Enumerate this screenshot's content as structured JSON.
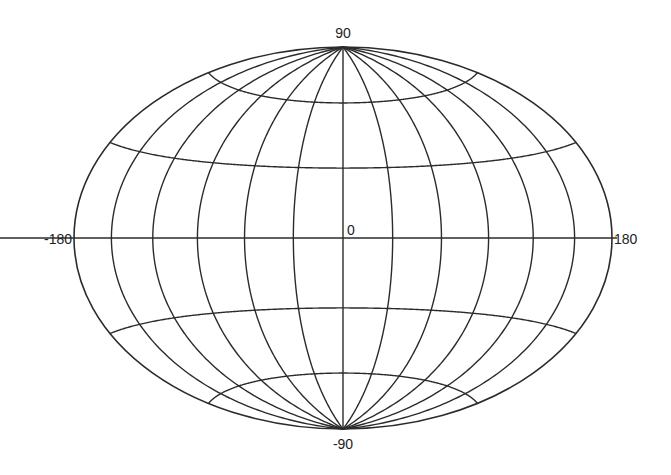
{
  "diagram": {
    "type": "map-projection-graticule",
    "projection": "Hammer (equal-area, elliptical)",
    "center": {
      "x": 343,
      "y": 238
    },
    "radius": {
      "x": 269,
      "y": 191
    },
    "line_color": "#2b2b2b",
    "meridians_deg": [
      -180,
      -150,
      -120,
      -90,
      -60,
      -30,
      0,
      30,
      60,
      90,
      120,
      150,
      180
    ],
    "parallels_deg": [
      -60,
      -30,
      0,
      30,
      60
    ],
    "labels": {
      "top": "90",
      "bottom": "-90",
      "left": "-180",
      "right": "180",
      "center": "0"
    }
  }
}
